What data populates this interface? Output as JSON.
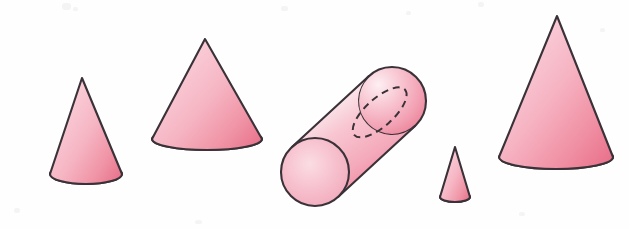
{
  "figure": {
    "canvas": {
      "width": 629,
      "height": 229,
      "background": "#fefefe"
    },
    "palette": {
      "highlight": "#fdf0f3",
      "fill_light": "#f8c2cd",
      "fill_mid": "#f4abba",
      "fill_deep": "#ee7f94",
      "fill_deepest": "#e8718a",
      "outline": "#3a3238",
      "dash": "#3a3238",
      "paper": "#fefefe",
      "speck": "#f2f2f2"
    },
    "stroke_width": 2.1,
    "dash_pattern": "7 5",
    "shapes": [
      {
        "name": "cone-small-left",
        "type": "cone",
        "label": "Cone 1 (small, left)",
        "apex": {
          "x": 82,
          "y": 78
        },
        "base_center": {
          "x": 86,
          "y": 174
        },
        "base_rx": 36,
        "base_ry": 10,
        "height": 96
      },
      {
        "name": "cone-medium-left",
        "type": "cone",
        "label": "Cone 2 (medium, wide base)",
        "apex": {
          "x": 205,
          "y": 39
        },
        "base_center": {
          "x": 207,
          "y": 139
        },
        "base_rx": 55,
        "base_ry": 11,
        "height": 100
      },
      {
        "name": "cylinder-tilted",
        "type": "cylinder",
        "label": "Cylinder (tilted, dashed hidden edge)",
        "near_cap_center": {
          "x": 315,
          "y": 172
        },
        "far_cap_center": {
          "x": 392,
          "y": 101
        },
        "cap_rx": 34,
        "cap_ry": 34,
        "tilt_degrees": -42,
        "has_hidden_dashed_edge": true
      },
      {
        "name": "cone-tiny",
        "type": "cone",
        "label": "Cone 3 (tiny)",
        "apex": {
          "x": 455,
          "y": 147
        },
        "base_center": {
          "x": 455,
          "y": 197
        },
        "base_rx": 15,
        "base_ry": 5,
        "height": 50
      },
      {
        "name": "cone-tall-right",
        "type": "cone",
        "label": "Cone 4 (tall, right)",
        "apex": {
          "x": 557,
          "y": 16
        },
        "base_center": {
          "x": 556,
          "y": 157
        },
        "base_rx": 57,
        "base_ry": 12,
        "height": 141
      }
    ],
    "specks": [
      {
        "x": 62,
        "y": 3,
        "w": 9,
        "h": 7
      },
      {
        "x": 73,
        "y": 7,
        "w": 5,
        "h": 4
      },
      {
        "x": 281,
        "y": 6,
        "w": 7,
        "h": 5
      },
      {
        "x": 406,
        "y": 11,
        "w": 5,
        "h": 4
      },
      {
        "x": 478,
        "y": 2,
        "w": 6,
        "h": 5
      },
      {
        "x": 600,
        "y": 28,
        "w": 5,
        "h": 4
      },
      {
        "x": 14,
        "y": 208,
        "w": 6,
        "h": 5
      },
      {
        "x": 195,
        "y": 220,
        "w": 7,
        "h": 4
      },
      {
        "x": 519,
        "y": 212,
        "w": 6,
        "h": 4
      }
    ]
  }
}
